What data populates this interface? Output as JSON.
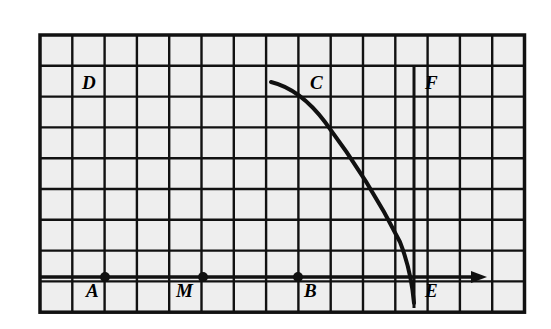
{
  "figure": {
    "kind": "geometry-grid-diagram",
    "background_color": "#ffffff",
    "grid": {
      "cell_fill": "#eeeeee",
      "line_color": "#111111",
      "columns": 15,
      "rows": 9,
      "origin_x": 40,
      "origin_y": 35,
      "cell_width": 32.3,
      "cell_height": 30.8,
      "outer_border_width": 3.5,
      "inner_line_width": 2.4
    },
    "axis": {
      "name": "horizontal-ray",
      "y": 277,
      "x_start": 40,
      "x_end": 487,
      "arrow": "right",
      "stroke_width": 3.5
    },
    "chord_line": {
      "name": "vertical-segment-FE",
      "x": 414,
      "y_top": 66,
      "y_bottom": 308,
      "stroke_width": 3
    },
    "arc": {
      "name": "quarter-arc-CE",
      "stroke_width": 4,
      "path": "M 271 82 Q 300 89 325 122 Q 370 182 400 242 Q 411 270 414 303"
    },
    "points": [
      {
        "id": "A",
        "label": "A",
        "cx": 105,
        "cy": 277,
        "label_x": 86,
        "label_y": 297,
        "dot_r": 5
      },
      {
        "id": "M",
        "label": "M",
        "cx": 203,
        "cy": 277,
        "label_x": 176,
        "label_y": 297,
        "dot_r": 5
      },
      {
        "id": "B",
        "label": "B",
        "cx": 298,
        "cy": 277,
        "label_x": 304,
        "label_y": 297,
        "dot_r": 5
      }
    ],
    "labels": [
      {
        "id": "D",
        "text": "D",
        "x": 82,
        "y": 89
      },
      {
        "id": "C",
        "text": "C",
        "x": 310,
        "y": 89
      },
      {
        "id": "F",
        "text": "F",
        "x": 425,
        "y": 89
      },
      {
        "id": "E",
        "text": "E",
        "x": 425,
        "y": 297
      }
    ]
  }
}
